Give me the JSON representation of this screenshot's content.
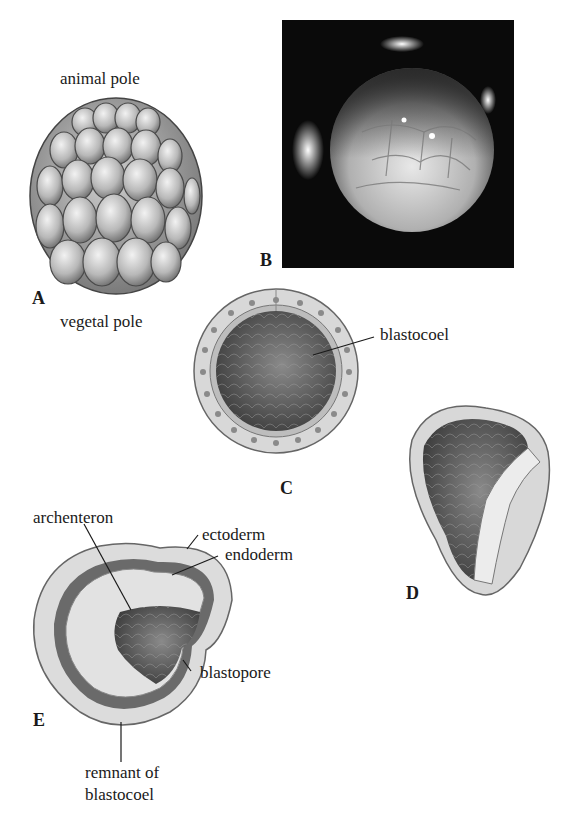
{
  "figure": {
    "panels": [
      {
        "id": "A",
        "letter": "A",
        "description": "morula (cleaving embryo, external view)"
      },
      {
        "id": "B",
        "letter": "B",
        "description": "photograph of cleaving embryo"
      },
      {
        "id": "C",
        "letter": "C",
        "description": "blastula in section"
      },
      {
        "id": "D",
        "letter": "D",
        "description": "blastula cut open, beginning invagination"
      },
      {
        "id": "E",
        "letter": "E",
        "description": "gastrula in section"
      }
    ],
    "labels": {
      "animal_pole": "animal pole",
      "vegetal_pole": "vegetal pole",
      "blastocoel": "blastocoel",
      "archenteron": "archenteron",
      "ectoderm": "ectoderm",
      "endoderm": "endoderm",
      "blastopore": "blastopore",
      "remnant_line1": "remnant of",
      "remnant_line2": "blastocoel"
    },
    "colors": {
      "ink": "#1a1a1a",
      "cell_light": "#e6e6e6",
      "cell_mid": "#a8a8a8",
      "cavity_dark": "#555555",
      "photo_bg": "#0a0a0a"
    }
  }
}
